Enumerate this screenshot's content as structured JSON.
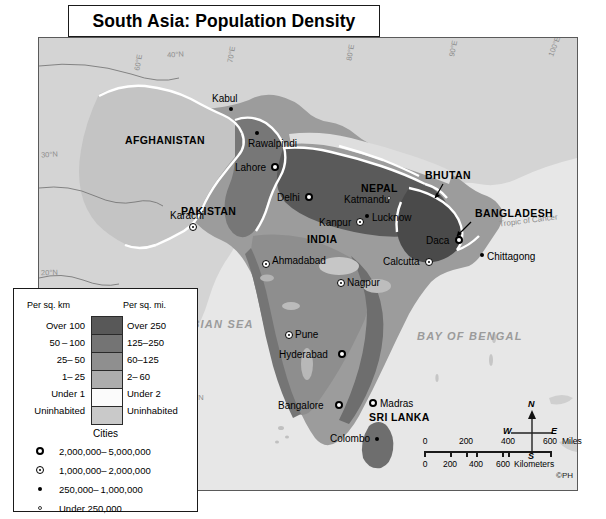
{
  "title": "South Asia: Population Density",
  "credit": "©PH",
  "map": {
    "countries": [
      {
        "name": "AFGHANISTAN",
        "x": 86,
        "y": 97
      },
      {
        "name": "PAKISTAN",
        "x": 142,
        "y": 168
      },
      {
        "name": "INDIA",
        "x": 268,
        "y": 196
      },
      {
        "name": "NEPAL",
        "x": 322,
        "y": 145
      },
      {
        "name": "BHUTAN",
        "x": 412,
        "y": 138
      },
      {
        "name": "BANGLADESH",
        "x": 439,
        "y": 174
      },
      {
        "name": "SRI LANKA",
        "x": 341,
        "y": 385
      }
    ],
    "seas": [
      {
        "name": "ARABIAN SEA",
        "x": 125,
        "y": 287
      },
      {
        "name": "BAY OF BENGAL",
        "x": 378,
        "y": 299
      }
    ],
    "cities": [
      {
        "name": "Kabul",
        "x": 190,
        "y": 69,
        "cls": "cls-c",
        "side": "above"
      },
      {
        "name": "Rawalpindi",
        "x": 216,
        "y": 93,
        "cls": "cls-c",
        "side": "left"
      },
      {
        "name": "Lahore",
        "x": 232,
        "y": 125,
        "cls": "cls-a",
        "side": "left"
      },
      {
        "name": "Delhi",
        "x": 266,
        "y": 155,
        "cls": "cls-a",
        "side": "left"
      },
      {
        "name": "Karachi",
        "x": 150,
        "y": 185,
        "cls": "cls-b",
        "side": "above"
      },
      {
        "name": "Kanpur",
        "x": 317,
        "y": 180,
        "cls": "cls-b",
        "side": "left"
      },
      {
        "name": "Lucknow",
        "x": 326,
        "y": 173,
        "cls": "cls-c",
        "side": "right"
      },
      {
        "name": "Katmandu",
        "x": 344,
        "y": 157,
        "cls": "cls-d",
        "side": "left"
      },
      {
        "name": "Ahmadabad",
        "x": 223,
        "y": 222,
        "cls": "cls-b",
        "side": "right"
      },
      {
        "name": "Daca",
        "x": 416,
        "y": 198,
        "cls": "cls-a",
        "side": "left"
      },
      {
        "name": "Chittagong",
        "x": 441,
        "y": 215,
        "cls": "cls-c",
        "side": "right"
      },
      {
        "name": "Calcutta",
        "x": 386,
        "y": 217,
        "cls": "cls-b",
        "side": "left"
      },
      {
        "name": "Nagpur",
        "x": 298,
        "y": 241,
        "cls": "cls-b",
        "side": "right"
      },
      {
        "name": "Pune",
        "x": 246,
        "y": 293,
        "cls": "cls-b",
        "side": "right"
      },
      {
        "name": "Hyderabad",
        "x": 299,
        "y": 312,
        "cls": "cls-a",
        "side": "left"
      },
      {
        "name": "Bangalore",
        "x": 296,
        "y": 363,
        "cls": "cls-a",
        "side": "left"
      },
      {
        "name": "Madras",
        "x": 330,
        "y": 362,
        "cls": "cls-a",
        "side": "right"
      },
      {
        "name": "Colombo",
        "x": 336,
        "y": 398,
        "cls": "cls-c",
        "side": "left"
      }
    ],
    "grid_labels": [
      {
        "text": "40°N",
        "x": 128,
        "y": 12,
        "rot": -3
      },
      {
        "text": "30°N",
        "x": 2,
        "y": 112,
        "rot": -3
      },
      {
        "text": "20°N",
        "x": 2,
        "y": 230,
        "rot": -2
      },
      {
        "text": "10°N",
        "x": 148,
        "y": 355,
        "rot": 0
      },
      {
        "text": "60°E",
        "x": 91,
        "y": 20,
        "rot": -80
      },
      {
        "text": "70°E",
        "x": 184,
        "y": 12,
        "rot": -80
      },
      {
        "text": "80°E",
        "x": 303,
        "y": 10,
        "rot": -80
      },
      {
        "text": "90°E",
        "x": 406,
        "y": 6,
        "rot": -78
      },
      {
        "text": "100°E",
        "x": 509,
        "y": 4,
        "rot": -70
      }
    ],
    "tropic_label": "Tropic of Cancer"
  },
  "legend": {
    "header_km": "Per sq. km",
    "header_mi": "Per sq. mi.",
    "rows": [
      {
        "km": "Over 100",
        "mi": "Over 250",
        "color": "#585858"
      },
      {
        "km": "50 – 100",
        "mi": "125–250",
        "color": "#747474"
      },
      {
        "km": "25– 50",
        "mi": "60–125",
        "color": "#8f8f8f"
      },
      {
        "km": "1– 25",
        "mi": "2– 60",
        "color": "#adadad"
      },
      {
        "km": "Under 1",
        "mi": "Under 2",
        "color": "#fbfbfb"
      },
      {
        "km": "Uninhabited",
        "mi": "Uninhabited",
        "color": "#c9c9c9"
      }
    ],
    "cities_title": "Cities",
    "city_classes": [
      {
        "label": "2,000,000– 5,000,000",
        "sym": "cls-a"
      },
      {
        "label": "1,000,000– 2,000,000",
        "sym": "cls-b"
      },
      {
        "label": "250,000– 1,000,000",
        "sym": "cls-c"
      },
      {
        "label": "Under 250,000",
        "sym": "cls-d"
      }
    ]
  },
  "scale": {
    "miles_ticks": [
      "0",
      "200",
      "400",
      "600"
    ],
    "miles_unit": "Miles",
    "km_ticks": [
      "0",
      "200",
      "400",
      "600"
    ],
    "km_unit": "Kilometers"
  },
  "compass": {
    "n": "N",
    "s": "S",
    "e": "E",
    "w": "W"
  }
}
